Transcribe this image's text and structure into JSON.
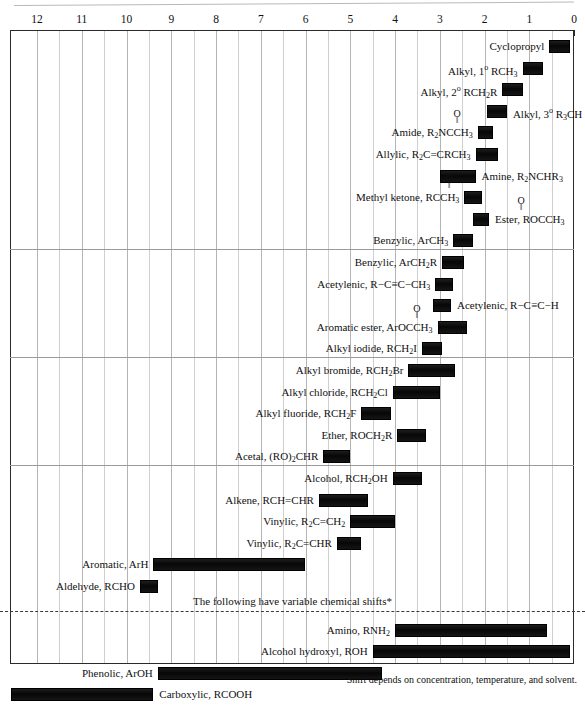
{
  "axis": {
    "label": "ppm (delta)",
    "ticks": [
      "12",
      "11",
      "10",
      "9",
      "8",
      "7",
      "6",
      "5",
      "4",
      "3",
      "2",
      "1",
      "0"
    ],
    "min": 0,
    "max": 12,
    "direction": "reversed"
  },
  "variable_note": "The following have variable chemical shifts*",
  "footnote": "*Shift depends on concentration, temperature, and solvent.",
  "chart_data": {
    "type": "bar",
    "orientation": "horizontal-range",
    "title": "",
    "xlabel": "Chemical shift (ppm)",
    "ylabel": "",
    "xlim": [
      12.5,
      0
    ],
    "grid": true,
    "legend": false,
    "sections": [
      {
        "name": "aliphatic",
        "entries": [
          {
            "label": "Cyclopropyl",
            "label_html": "Cyclopropyl",
            "start": 0.55,
            "end": 0.1,
            "label_side": "left"
          },
          {
            "label": "Alkyl, 1° RCH3",
            "label_html": "Alkyl, 1<sup>o</sup> RCH<sub>3</sub>",
            "start": 1.15,
            "end": 0.7,
            "label_side": "left"
          },
          {
            "label": "Alkyl, 2° RCH2R",
            "label_html": "Alkyl, 2<sup>o</sup> RCH<sub>2</sub>R",
            "start": 1.6,
            "end": 1.15,
            "label_side": "left"
          },
          {
            "label": "Alkyl, 3° R3CH",
            "label_html": "Alkyl, 3<sup>o</sup> R<sub>3</sub>CH",
            "start": 1.95,
            "end": 1.5,
            "label_side": "right"
          },
          {
            "label": "Amide, R2NCCH3",
            "label_html": "R<sub>2</sub>NCCH<sub>3</sub>",
            "prefix": "Amide, ",
            "carbonyl": true,
            "start": 2.15,
            "end": 1.8,
            "label_side": "left"
          },
          {
            "label": "Allylic, R2C=CRCH3",
            "label_html": "Allylic, R<sub>2</sub>C=CRCH<sub>3</sub>",
            "start": 2.2,
            "end": 1.7,
            "label_side": "left"
          },
          {
            "label": "Amine, R2NCHR3",
            "label_html": "Amine, R<sub>2</sub>NCHR<sub>3</sub>",
            "start": 3.0,
            "end": 2.2,
            "label_side": "right"
          },
          {
            "label": "Methyl ketone, RCCH3",
            "label_html": "RCCH<sub>3</sub>",
            "prefix": "Methyl ketone, ",
            "carbonyl": true,
            "start": 2.45,
            "end": 2.05,
            "label_side": "left"
          },
          {
            "label": "Ester, ROCCH3",
            "label_html": "ROCCH<sub>3</sub>",
            "prefix": "Ester, ",
            "carbonyl": true,
            "start": 2.25,
            "end": 1.9,
            "label_side": "right"
          },
          {
            "label": "Benzylic, ArCH3",
            "label_html": "Benzylic, ArCH<sub>3</sub>",
            "start": 2.7,
            "end": 2.25,
            "label_side": "left"
          }
        ]
      },
      {
        "name": "benzylic-acetylenic",
        "entries": [
          {
            "label": "Benzylic, ArCH2R",
            "label_html": "Benzylic, ArCH<sub>2</sub>R",
            "start": 2.95,
            "end": 2.45,
            "label_side": "left"
          },
          {
            "label": "Acetylenic, R-C≡C-CH3",
            "label_html": "Acetylenic, R−C≡C−CH<sub>3</sub>",
            "start": 3.1,
            "end": 2.7,
            "label_side": "left"
          },
          {
            "label": "Acetylenic, R-C≡C-H",
            "label_html": "Acetylenic, R−C≡C−H",
            "start": 3.15,
            "end": 2.75,
            "label_side": "right"
          },
          {
            "label": "Aromatic ester, ArOCCH3",
            "label_html": "ArOCCH<sub>3</sub>",
            "prefix": "Aromatic ester, ",
            "carbonyl": true,
            "start": 3.05,
            "end": 2.4,
            "label_side": "left"
          },
          {
            "label": "Alkyl iodide, RCH2I",
            "label_html": "Alkyl iodide, RCH<sub>2</sub>I",
            "start": 3.4,
            "end": 2.95,
            "label_side": "left"
          }
        ]
      },
      {
        "name": "halides-ethers",
        "entries": [
          {
            "label": "Alkyl bromide, RCH2Br",
            "label_html": "Alkyl bromide, RCH<sub>2</sub>Br",
            "start": 3.7,
            "end": 2.65,
            "label_side": "left"
          },
          {
            "label": "Alkyl chloride, RCH2Cl",
            "label_html": "Alkyl chloride, RCH<sub>2</sub>Cl",
            "start": 4.05,
            "end": 3.0,
            "label_side": "left"
          },
          {
            "label": "Alkyl fluoride, RCH2F",
            "label_html": "Alkyl fluoride, RCH<sub>2</sub>F",
            "start": 4.75,
            "end": 4.1,
            "label_side": "left"
          },
          {
            "label": "Ether, ROCH2R",
            "label_html": "Ether, ROCH<sub>2</sub>R",
            "start": 3.95,
            "end": 3.3,
            "label_side": "left"
          },
          {
            "label": "Acetal, (RO)2CHR",
            "label_html": "Acetal, (RO)<sub>2</sub>CHR",
            "start": 5.6,
            "end": 5.0,
            "label_side": "left"
          }
        ]
      },
      {
        "name": "alcohol-alkene-aromatic",
        "entries": [
          {
            "label": "Alcohol, RCH2OH",
            "label_html": "Alcohol, RCH<sub>2</sub>OH",
            "start": 4.05,
            "end": 3.4,
            "label_side": "left"
          },
          {
            "label": "Alkene, RCH=CHR",
            "label_html": "Alkene, RCH=CHR",
            "start": 5.7,
            "end": 4.6,
            "label_side": "left"
          },
          {
            "label": "Vinylic, R2C=CH2",
            "label_html": "Vinylic, R<sub>2</sub>C=CH<sub>2</sub>",
            "start": 5.0,
            "end": 4.0,
            "label_side": "left"
          },
          {
            "label": "Vinylic, R2C=CHR",
            "label_html": "Vinylic, R<sub>2</sub>C=CHR",
            "start": 5.3,
            "end": 4.75,
            "label_side": "left"
          },
          {
            "label": "Aromatic, ArH",
            "label_html": "Aromatic, ArH",
            "start": 9.4,
            "end": 6.0,
            "label_side": "left"
          },
          {
            "label": "Aldehyde, RCHO",
            "label_html": "Aldehyde, RCHO",
            "start": 9.7,
            "end": 9.3,
            "label_side": "left"
          }
        ]
      },
      {
        "name": "variable-shift",
        "entries": [
          {
            "label": "Amino, RNH2",
            "label_html": "Amino, RNH<sub>2</sub>",
            "start": 4.0,
            "end": 0.6,
            "label_side": "left"
          },
          {
            "label": "Alcohol hydroxyl, ROH",
            "label_html": "Alcohol hydroxyl, ROH",
            "start": 4.5,
            "end": 0.1,
            "label_side": "left"
          },
          {
            "label": "Phenolic, ArOH",
            "label_html": "Phenolic, ArOH",
            "start": 9.3,
            "end": 4.3,
            "label_side": "left"
          },
          {
            "label": "Carboxylic, RCOOH",
            "label_html": "Carboxylic, RCOOH",
            "start": 12.6,
            "end": 9.4,
            "label_side": "right"
          }
        ]
      }
    ]
  }
}
